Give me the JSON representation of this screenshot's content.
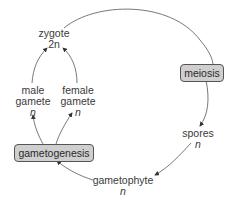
{
  "diagram": {
    "title": "",
    "nodes": {
      "zygote": {
        "label": "zygote",
        "ploidy": "2n"
      },
      "male_gamete": {
        "label": "male gamete",
        "line1": "male",
        "line2": "gamete",
        "ploidy": "n"
      },
      "female_gamete": {
        "label": "female gamete",
        "line1": "female",
        "line2": "gamete",
        "ploidy": "n"
      },
      "meiosis": {
        "label": "meiosis"
      },
      "spores": {
        "label": "spores",
        "ploidy": "n"
      },
      "gametophyte": {
        "label": "gametophyte",
        "ploidy": "n"
      },
      "gametogenesis": {
        "label": "gametogenesis"
      }
    },
    "edges": [
      {
        "from": "zygote",
        "to": "meiosis"
      },
      {
        "from": "meiosis",
        "to": "spores"
      },
      {
        "from": "spores",
        "to": "gametophyte"
      },
      {
        "from": "gametophyte",
        "to": "gametogenesis"
      },
      {
        "from": "gametogenesis",
        "to": "male_gamete"
      },
      {
        "from": "gametogenesis",
        "to": "female_gamete"
      },
      {
        "from": "male_gamete",
        "to": "zygote"
      },
      {
        "from": "female_gamete",
        "to": "zygote"
      }
    ],
    "colors": {
      "box_fill": "#cfcfcf",
      "box_border": "#555555",
      "line": "#444444"
    }
  }
}
